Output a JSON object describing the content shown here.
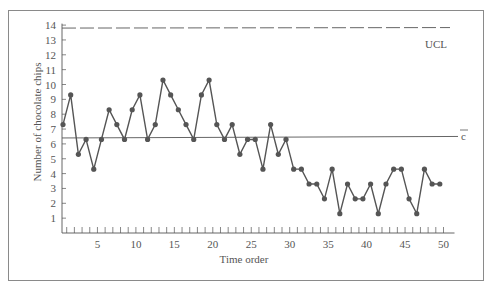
{
  "chart_data": {
    "type": "line",
    "title": "",
    "xlabel": "Time order",
    "ylabel": "Number of chocolate chips",
    "x": [
      1,
      2,
      3,
      4,
      5,
      6,
      7,
      8,
      9,
      10,
      11,
      12,
      13,
      14,
      15,
      16,
      17,
      18,
      19,
      20,
      21,
      22,
      23,
      24,
      25,
      26,
      27,
      28,
      29,
      30,
      31,
      32,
      33,
      34,
      35,
      36,
      37,
      38,
      39,
      40,
      41,
      42,
      43,
      44,
      45,
      46,
      47,
      48,
      49,
      50
    ],
    "series": [
      {
        "name": "Chocolate chips per cookie",
        "values": [
          7,
          9,
          5,
          6,
          4,
          6,
          8,
          7,
          6,
          8,
          9,
          6,
          7,
          10,
          9,
          8,
          7,
          6,
          9,
          10,
          7,
          6,
          7,
          5,
          6,
          6,
          4,
          7,
          5,
          6,
          4,
          4,
          3,
          3,
          2,
          4,
          1,
          3,
          2,
          2,
          3,
          1,
          3,
          4,
          4,
          2,
          1,
          4,
          3,
          3
        ]
      }
    ],
    "reference_lines": [
      {
        "label": "UCL",
        "value": 13.8,
        "style": "dashed"
      },
      {
        "label": "c̄",
        "value": 6.4,
        "style": "solid"
      }
    ],
    "xticks": [
      5,
      10,
      15,
      20,
      25,
      30,
      35,
      40,
      45,
      50
    ],
    "yticks": [
      1,
      2,
      3,
      4,
      5,
      6,
      7,
      8,
      9,
      10,
      11,
      12,
      13,
      14
    ],
    "xlim": [
      0,
      51
    ],
    "ylim": [
      0,
      14.3
    ],
    "grid": false,
    "legend": "none"
  },
  "labels": {
    "ucl": "UCL",
    "cbar": "c",
    "xlabel": "Time order",
    "ylabel": "Number of chocolate chips"
  },
  "colors": {
    "line": "#555555",
    "marker": "#555555",
    "frame": "#8a8a8a",
    "text": "#555555"
  }
}
